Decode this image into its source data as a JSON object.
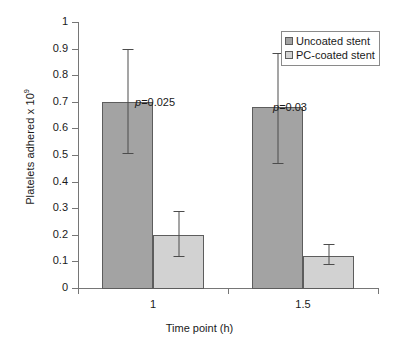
{
  "chart_data": {
    "type": "bar",
    "title": "",
    "xlabel": "Time point (h)",
    "ylabel": "Platelets adhered x 10",
    "ylabel_exponent": "9",
    "categories": [
      "1",
      "1.5"
    ],
    "ylim": [
      0,
      1
    ],
    "yticks": [
      "0",
      "0.1",
      "0.2",
      "0.3",
      "0.4",
      "0.5",
      "0.6",
      "0.7",
      "0.8",
      "0.9",
      "1"
    ],
    "ytick_values": [
      0,
      0.1,
      0.2,
      0.3,
      0.4,
      0.5,
      0.6,
      0.7,
      0.8,
      0.9,
      1
    ],
    "grid": false,
    "legend_position": "top-right",
    "series": [
      {
        "name": "Uncoated stent",
        "color": "#a3a3a3",
        "values": [
          0.7,
          0.68
        ],
        "err_low": [
          0.505,
          0.465
        ],
        "err_high": [
          0.9,
          0.885
        ]
      },
      {
        "name": "PC-coated stent",
        "color": "#d2d2d2",
        "values": [
          0.2,
          0.12
        ],
        "err_low": [
          0.115,
          0.085
        ],
        "err_high": [
          0.29,
          0.165
        ]
      }
    ],
    "annotations": [
      {
        "text_italic": "p",
        "text": "=0.025",
        "category": "1"
      },
      {
        "text_italic": "p",
        "text": "=0.03",
        "category": "1.5"
      }
    ]
  },
  "legend": {
    "items": [
      {
        "label": "Uncoated stent"
      },
      {
        "label": "PC-coated stent"
      }
    ]
  }
}
